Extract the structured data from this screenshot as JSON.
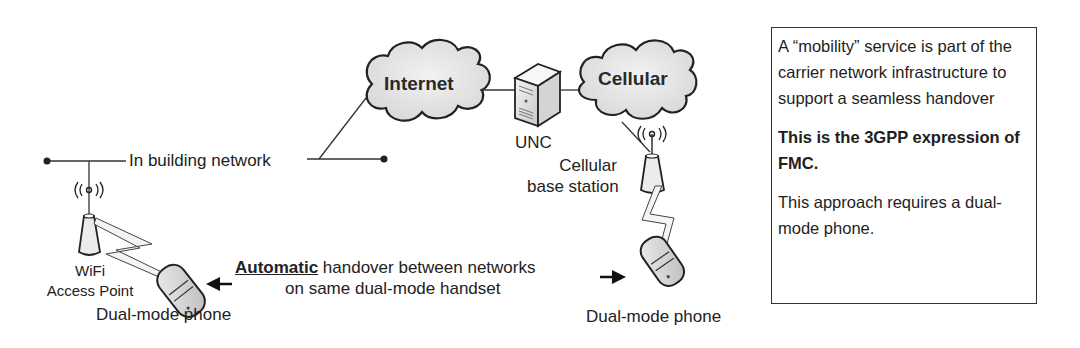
{
  "diagram": {
    "clouds": {
      "internet": "Internet",
      "cellular": "Cellular"
    },
    "nodes": {
      "unc": "UNC",
      "cellular_base_station_line1": "Cellular",
      "cellular_base_station_line2": "base station",
      "wifi_line1": "WiFi",
      "wifi_line2": "Access Point",
      "phone_left": "Dual-mode phone",
      "phone_right": "Dual-mode phone",
      "in_building_network": "In building network"
    },
    "handover": {
      "emphasis": "Automatic",
      "line1_rest": " handover between networks",
      "line2": "on same dual-mode handset"
    },
    "icons": {
      "internet": "cloud-icon",
      "cellular": "cloud-icon",
      "unc": "server-icon",
      "wifi_ap": "wireless-access-point-icon",
      "base_station": "cell-tower-icon",
      "phones": "mobile-phone-icon",
      "links": "lightning-wireless-link-icon",
      "arrows": "arrow-icon"
    }
  },
  "note": {
    "paragraph1": "A “mobility” service is part of the carrier network infrastructure to support a seamless handover",
    "paragraph2": "This is the 3GPP expression of FMC.",
    "paragraph3": "This approach requires a dual-mode phone."
  },
  "colors": {
    "line": "#333333",
    "cloud_fill": "#e6e6e6",
    "text": "#222222"
  }
}
